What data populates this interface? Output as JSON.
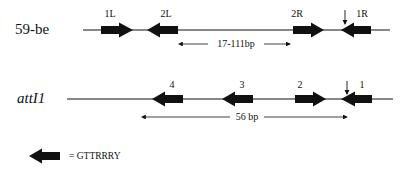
{
  "rows": [
    {
      "id": "59-be",
      "name": "59-be",
      "italic": false,
      "line": {
        "x1": 83,
        "x2": 390,
        "y": 30
      },
      "elements": [
        {
          "label": "1L",
          "direction": "right",
          "x": 101,
          "label_x": 110
        },
        {
          "label": "2L",
          "direction": "left",
          "x": 147,
          "label_x": 166
        },
        {
          "label": "2R",
          "direction": "right",
          "x": 293,
          "label_x": 297
        },
        {
          "label": "1R",
          "direction": "left",
          "x": 341,
          "label_x": 361
        }
      ],
      "cut_site_x": 345,
      "span": {
        "label": "17-111bp",
        "x1": 182,
        "x2": 290,
        "y": 44
      }
    },
    {
      "id": "attI1",
      "name": "attI1",
      "italic": true,
      "line": {
        "x1": 67,
        "x2": 393,
        "y": 99
      },
      "elements": [
        {
          "label": "4",
          "direction": "left",
          "x": 152,
          "label_x": 172
        },
        {
          "label": "3",
          "direction": "left",
          "x": 222,
          "label_x": 242
        },
        {
          "label": "2",
          "direction": "right",
          "x": 295,
          "label_x": 300
        },
        {
          "label": "1",
          "direction": "left",
          "x": 341,
          "label_x": 362
        }
      ],
      "cut_site_x": 347,
      "span": {
        "label": "56 bp",
        "x1": 145,
        "x2": 347,
        "y": 117
      }
    }
  ],
  "legend": {
    "symbol": "left-arrow",
    "text": "= GTTRRRY"
  },
  "colors": {
    "ink": "#111111",
    "background": "#ffffff"
  }
}
